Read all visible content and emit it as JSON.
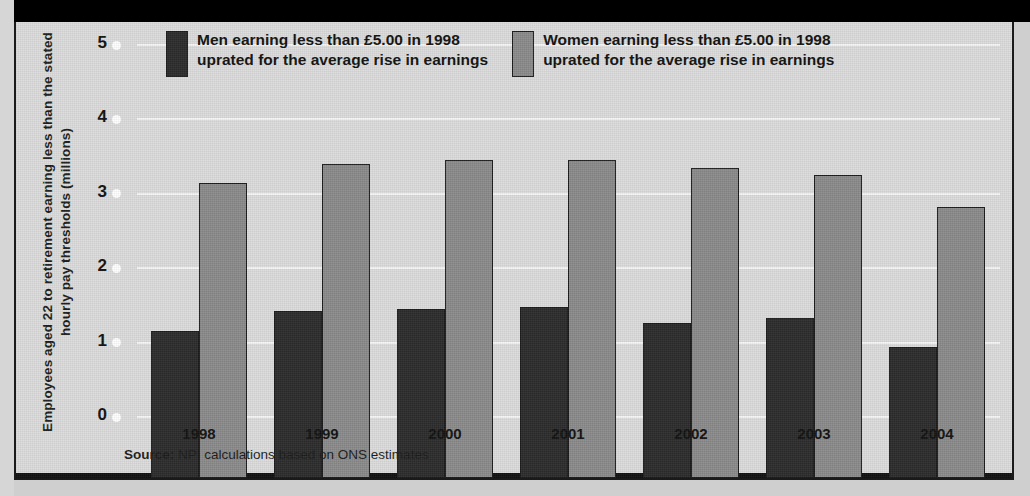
{
  "chart_data": {
    "type": "bar",
    "title": "",
    "subtitle": "",
    "xlabel": "",
    "ylabel": "Employees aged 22 to retirement earning less than the stated hourly pay thresholds (millions)",
    "categories": [
      "1998",
      "1999",
      "2000",
      "2001",
      "2002",
      "2003",
      "2004"
    ],
    "series": [
      {
        "name": "Men earning less than £5.00 in 1998 uprated for the average rise in earnings",
        "color": "#2b2b2b",
        "values": [
          1.97,
          2.24,
          2.27,
          2.3,
          2.08,
          2.15,
          1.76
        ]
      },
      {
        "name": "Women earning less than £5.00 in 1998 uprated for the average rise in earnings",
        "color": "#8a8a8a",
        "values": [
          3.96,
          4.22,
          4.28,
          4.28,
          4.17,
          4.07,
          3.64
        ]
      }
    ],
    "ylim": [
      0,
      5
    ],
    "yticks": [
      "0",
      "1",
      "2",
      "3",
      "4",
      "5"
    ],
    "grid": true,
    "legend_position": "top"
  },
  "legend": {
    "items": [
      {
        "swatch": "men",
        "label": "Men earning less than £5.00 in 1998\nuprated for the average rise in earnings"
      },
      {
        "swatch": "women",
        "label": "Women earning less than £5.00 in 1998\nuprated for the average rise in earnings"
      }
    ]
  },
  "axis": {
    "y_title": "Employees aged 22 to retirement earning less than the stated hourly pay thresholds (millions)"
  },
  "source": {
    "prefix": "Source:",
    "text": " NPI calculations based on ONS estimates"
  },
  "colors": {
    "men": "#2b2b2b",
    "women": "#8a8a8a",
    "panel_background": "#dcdcdc",
    "gridline": "#f6f6f6",
    "top_band": "#000000"
  }
}
